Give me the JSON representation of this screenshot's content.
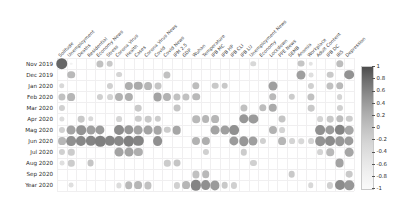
{
  "chart_data": {
    "type": "heatmap",
    "title": "",
    "xlabel": "",
    "ylabel": "",
    "legend_position": "right",
    "grid": true,
    "encoding": "bubble size and gray intensity encode correlation value",
    "colorbar": {
      "min": -1,
      "max": 1,
      "ticks": [
        "1",
        "0.8",
        "0.6",
        "0.4",
        "0.2",
        "0",
        "-0.2",
        "-0.4",
        "-0.6",
        "-0.8",
        "-1"
      ],
      "tick_values": [
        1,
        0.8,
        0.6,
        0.4,
        0.2,
        0,
        -0.2,
        -0.4,
        -0.6,
        -0.8,
        -1
      ],
      "colormap": "greys_reversed"
    },
    "categories_x": [
      "Solitude",
      "Unemployment",
      "Deaths",
      "Residential",
      "Economy News",
      "Stress",
      "Corona Virus",
      "Health",
      "Cases",
      "Corona Virus News",
      "Covid",
      "Covid News",
      "IPM 2.5",
      "GDP",
      "Wuhan",
      "Temperature",
      "IPB MC",
      "IPB HP",
      "IPB CLI",
      "IPB LU",
      "Unemployment News",
      "Economy",
      "Lockdown",
      "PPE News",
      "SEMB",
      "Anomia",
      "Workplace",
      "Adult Content",
      "IPB DC",
      "IRS",
      "Depression"
    ],
    "categories_y": [
      "Nov 2019",
      "Dec 2019",
      "Jan 2020",
      "Feb 2020",
      "Mar 2020",
      "Apr 2020",
      "Mag 2020",
      "Jun 2020",
      "Jul 2020",
      "Aug 2020",
      "Sep 2020",
      "Year 2020"
    ],
    "values": [
      [
        0.78,
        0.04,
        0.0,
        0.0,
        0.3,
        0.26,
        0.0,
        0.0,
        0.0,
        0.0,
        0.0,
        0.0,
        0.0,
        0.0,
        0.0,
        0.0,
        0.0,
        0.0,
        0.0,
        0.0,
        0.18,
        0.0,
        0.0,
        0.0,
        0.0,
        0.28,
        0.12,
        0.0,
        0.0,
        0.32,
        0.0
      ],
      [
        0.0,
        0.34,
        0.0,
        0.0,
        0.0,
        0.0,
        0.2,
        0.0,
        0.0,
        0.0,
        0.0,
        0.3,
        0.0,
        0.0,
        0.0,
        0.0,
        0.0,
        0.0,
        0.0,
        0.0,
        0.0,
        0.0,
        0.0,
        0.0,
        0.0,
        0.48,
        0.14,
        0.0,
        0.26,
        0.0,
        0.55
      ],
      [
        0.18,
        0.0,
        0.0,
        0.0,
        0.0,
        0.22,
        0.0,
        0.4,
        0.42,
        0.36,
        0.28,
        0.0,
        0.0,
        0.0,
        0.32,
        0.0,
        0.26,
        0.26,
        0.0,
        0.0,
        0.0,
        0.0,
        0.48,
        0.0,
        0.0,
        0.0,
        0.22,
        0.0,
        0.3,
        0.34,
        0.0
      ],
      [
        0.3,
        0.36,
        0.0,
        0.0,
        0.22,
        0.2,
        0.38,
        0.4,
        0.0,
        0.0,
        0.46,
        0.38,
        0.3,
        0.3,
        0.34,
        0.0,
        0.0,
        0.0,
        0.0,
        0.0,
        0.0,
        0.0,
        0.34,
        0.0,
        0.24,
        0.0,
        0.3,
        0.0,
        0.0,
        0.2,
        0.0
      ],
      [
        0.22,
        0.0,
        0.0,
        0.0,
        0.0,
        0.0,
        0.0,
        0.0,
        0.26,
        0.0,
        0.0,
        0.0,
        0.28,
        0.0,
        0.0,
        0.0,
        0.0,
        0.0,
        0.0,
        0.3,
        0.0,
        0.32,
        0.42,
        0.0,
        0.0,
        0.0,
        0.26,
        0.0,
        0.0,
        0.22,
        0.0
      ],
      [
        0.16,
        0.0,
        0.26,
        0.18,
        0.0,
        0.0,
        0.2,
        0.0,
        0.24,
        0.26,
        0.24,
        0.0,
        0.0,
        0.0,
        0.34,
        0.36,
        0.36,
        0.0,
        0.0,
        0.52,
        0.5,
        0.0,
        0.0,
        0.28,
        0.0,
        0.0,
        0.0,
        0.2,
        0.26,
        0.32,
        0.24
      ],
      [
        0.22,
        0.46,
        0.54,
        0.48,
        0.5,
        0.0,
        0.58,
        0.52,
        0.46,
        0.46,
        0.44,
        0.24,
        0.44,
        0.0,
        0.0,
        0.0,
        0.46,
        0.48,
        0.56,
        0.0,
        0.0,
        0.0,
        0.38,
        0.2,
        0.0,
        0.0,
        0.0,
        0.56,
        0.5,
        0.62,
        0.44
      ],
      [
        0.36,
        0.56,
        0.6,
        0.62,
        0.64,
        0.62,
        0.6,
        0.64,
        0.62,
        0.0,
        0.56,
        0.0,
        0.0,
        0.0,
        0.38,
        0.4,
        0.0,
        0.0,
        0.5,
        0.52,
        0.48,
        0.22,
        0.0,
        0.36,
        0.2,
        0.18,
        0.2,
        0.54,
        0.58,
        0.52,
        0.5
      ],
      [
        0.22,
        0.24,
        0.0,
        0.0,
        0.0,
        0.0,
        0.46,
        0.46,
        0.4,
        0.0,
        0.0,
        0.0,
        0.0,
        0.0,
        0.0,
        0.22,
        0.0,
        0.0,
        0.0,
        0.24,
        0.0,
        0.0,
        0.0,
        0.0,
        0.0,
        0.0,
        0.0,
        0.2,
        0.34,
        0.0,
        0.44
      ],
      [
        0.14,
        0.24,
        0.0,
        0.28,
        0.0,
        0.0,
        0.0,
        0.0,
        0.0,
        0.0,
        0.0,
        0.24,
        0.28,
        0.0,
        0.0,
        0.0,
        0.0,
        0.0,
        0.0,
        0.0,
        0.22,
        0.0,
        0.0,
        0.0,
        0.0,
        0.0,
        0.0,
        0.0,
        0.0,
        0.46,
        0.0
      ],
      [
        0.0,
        0.0,
        0.0,
        0.0,
        0.0,
        0.0,
        0.0,
        0.0,
        0.0,
        0.0,
        0.0,
        0.0,
        0.0,
        0.0,
        0.3,
        0.34,
        0.0,
        0.0,
        0.0,
        0.0,
        0.0,
        0.0,
        0.0,
        0.0,
        0.26,
        0.0,
        0.0,
        0.0,
        0.0,
        0.0,
        0.26
      ],
      [
        0.0,
        0.14,
        0.0,
        0.0,
        0.0,
        0.0,
        0.16,
        0.34,
        0.36,
        0.3,
        0.0,
        0.0,
        0.22,
        0.36,
        0.62,
        0.56,
        0.5,
        0.26,
        0.22,
        0.0,
        0.0,
        0.0,
        0.0,
        0.0,
        0.0,
        0.0,
        0.18,
        0.0,
        0.22,
        0.58,
        0.52
      ]
    ]
  }
}
